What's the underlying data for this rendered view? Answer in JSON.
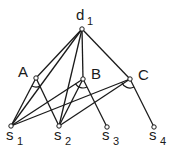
{
  "diagram": {
    "type": "and-or graph",
    "nodes": [
      {
        "id": "d1",
        "label": "d",
        "subscript": "1",
        "x": 82,
        "y": 29,
        "lx": 76,
        "ly": 20
      },
      {
        "id": "A",
        "label": "A",
        "subscript": "",
        "x": 36,
        "y": 78,
        "lx": 18,
        "ly": 77
      },
      {
        "id": "B",
        "label": "B",
        "subscript": "",
        "x": 83,
        "y": 79,
        "lx": 91,
        "ly": 79
      },
      {
        "id": "C",
        "label": "C",
        "subscript": "",
        "x": 130,
        "y": 79,
        "lx": 138,
        "ly": 80
      },
      {
        "id": "s1",
        "label": "s",
        "subscript": "1",
        "x": 11,
        "y": 126,
        "lx": 6,
        "ly": 140
      },
      {
        "id": "s2",
        "label": "s",
        "subscript": "2",
        "x": 59,
        "y": 126,
        "lx": 54,
        "ly": 140
      },
      {
        "id": "s3",
        "label": "s",
        "subscript": "3",
        "x": 107,
        "y": 127,
        "lx": 102,
        "ly": 140
      },
      {
        "id": "s4",
        "label": "s",
        "subscript": "4",
        "x": 154,
        "y": 127,
        "lx": 149,
        "ly": 140
      }
    ],
    "edges": [
      [
        "d1",
        "A"
      ],
      [
        "d1",
        "s1"
      ],
      [
        "d1",
        "s2"
      ],
      [
        "d1",
        "B"
      ],
      [
        "d1",
        "C"
      ],
      [
        "A",
        "s1"
      ],
      [
        "A",
        "s2"
      ],
      [
        "B",
        "s1"
      ],
      [
        "B",
        "s2"
      ],
      [
        "B",
        "s3"
      ],
      [
        "C",
        "s1"
      ],
      [
        "C",
        "s2"
      ],
      [
        "C",
        "s4"
      ]
    ],
    "and_arcs": [
      {
        "node": "A",
        "from": "s1",
        "to": "s2"
      },
      {
        "node": "B",
        "from": "s1",
        "to": "s3"
      },
      {
        "node": "C",
        "from": "s1",
        "to": "s4"
      }
    ]
  }
}
